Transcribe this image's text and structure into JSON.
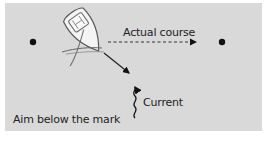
{
  "diagram": {
    "labels": {
      "actual_course": "Actual course",
      "current": "Current",
      "caption": "Aim below the mark"
    },
    "elements": {
      "start_mark": "dot-left",
      "target_mark": "dot-right",
      "boat": "sailboat-icon",
      "heading_arrow": "diagonal arrow from boat bow",
      "course_arrow": "dashed arrow to right",
      "current_arrow": "wavy upward arrow"
    },
    "colors": {
      "panel_bg": "#d9d9d9",
      "page_bg": "#ffffff",
      "ink": "#111111",
      "boat_fill": "#f4f4f4",
      "boat_stroke": "#555555"
    }
  }
}
